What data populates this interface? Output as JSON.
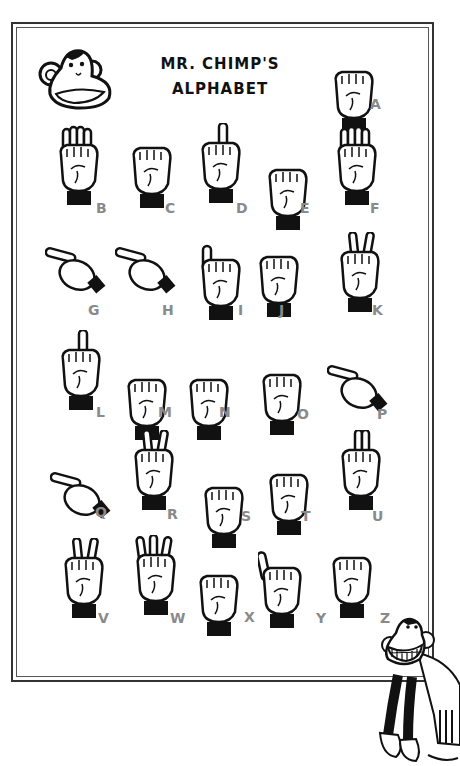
{
  "poster": {
    "title_line1": "MR. CHIMP'S",
    "title_line2": "ALPHABET",
    "logo_icon": "chimp-head-icon",
    "mascot_icon": "grinning-chimp-icon",
    "letter_color": "#8a8a8a",
    "line_color": "#111111"
  },
  "signs": [
    {
      "letter": "A",
      "pose": "fist-thumb-side",
      "x": 330,
      "y": 52
    },
    {
      "letter": "B",
      "pose": "flat-hand-thumb-in",
      "x": 55,
      "y": 125
    },
    {
      "letter": "C",
      "pose": "curved-hand",
      "x": 128,
      "y": 128
    },
    {
      "letter": "D",
      "pose": "index-up",
      "x": 197,
      "y": 123
    },
    {
      "letter": "E",
      "pose": "curled-fingers",
      "x": 264,
      "y": 150
    },
    {
      "letter": "F",
      "pose": "three-up-ok",
      "x": 333,
      "y": 125
    },
    {
      "letter": "G",
      "pose": "point-sideways",
      "x": 45,
      "y": 245
    },
    {
      "letter": "H",
      "pose": "two-sideways",
      "x": 115,
      "y": 245
    },
    {
      "letter": "I",
      "pose": "pinky-up",
      "x": 197,
      "y": 240
    },
    {
      "letter": "J",
      "pose": "pinky-hook",
      "x": 255,
      "y": 237
    },
    {
      "letter": "K",
      "pose": "v-thumb-between",
      "x": 336,
      "y": 232
    },
    {
      "letter": "L",
      "pose": "l-shape",
      "x": 57,
      "y": 330
    },
    {
      "letter": "M",
      "pose": "three-over-thumb",
      "x": 123,
      "y": 360
    },
    {
      "letter": "N",
      "pose": "two-over-thumb",
      "x": 185,
      "y": 360
    },
    {
      "letter": "O",
      "pose": "o-shape",
      "x": 258,
      "y": 355
    },
    {
      "letter": "P",
      "pose": "k-down",
      "x": 327,
      "y": 363
    },
    {
      "letter": "Q",
      "pose": "g-down",
      "x": 50,
      "y": 470
    },
    {
      "letter": "R",
      "pose": "crossed-fingers",
      "x": 130,
      "y": 430
    },
    {
      "letter": "S",
      "pose": "fist-thumb-front",
      "x": 200,
      "y": 468
    },
    {
      "letter": "T",
      "pose": "thumb-under-index",
      "x": 265,
      "y": 455
    },
    {
      "letter": "U",
      "pose": "two-up-together",
      "x": 337,
      "y": 430
    },
    {
      "letter": "V",
      "pose": "v-sign",
      "x": 60,
      "y": 538
    },
    {
      "letter": "W",
      "pose": "three-up",
      "x": 132,
      "y": 535
    },
    {
      "letter": "X",
      "pose": "hooked-index",
      "x": 195,
      "y": 556
    },
    {
      "letter": "Y",
      "pose": "thumb-pinky-out",
      "x": 258,
      "y": 548
    },
    {
      "letter": "Z",
      "pose": "index-trace-z",
      "x": 328,
      "y": 538
    }
  ],
  "labels": [
    {
      "letter": "A",
      "x": 370,
      "y": 104
    },
    {
      "letter": "B",
      "x": 96,
      "y": 208
    },
    {
      "letter": "C",
      "x": 165,
      "y": 208
    },
    {
      "letter": "D",
      "x": 236,
      "y": 208
    },
    {
      "letter": "E",
      "x": 300,
      "y": 208
    },
    {
      "letter": "F",
      "x": 370,
      "y": 208
    },
    {
      "letter": "G",
      "x": 88,
      "y": 310
    },
    {
      "letter": "H",
      "x": 162,
      "y": 310
    },
    {
      "letter": "I",
      "x": 238,
      "y": 310
    },
    {
      "letter": "J",
      "x": 279,
      "y": 310
    },
    {
      "letter": "K",
      "x": 372,
      "y": 310
    },
    {
      "letter": "L",
      "x": 96,
      "y": 412
    },
    {
      "letter": "M",
      "x": 158,
      "y": 412
    },
    {
      "letter": "N",
      "x": 219,
      "y": 412
    },
    {
      "letter": "O",
      "x": 297,
      "y": 414
    },
    {
      "letter": "P",
      "x": 377,
      "y": 414
    },
    {
      "letter": "Q",
      "x": 95,
      "y": 512
    },
    {
      "letter": "R",
      "x": 167,
      "y": 514
    },
    {
      "letter": "S",
      "x": 241,
      "y": 516
    },
    {
      "letter": "T",
      "x": 301,
      "y": 516
    },
    {
      "letter": "U",
      "x": 372,
      "y": 516
    },
    {
      "letter": "V",
      "x": 98,
      "y": 618
    },
    {
      "letter": "W",
      "x": 170,
      "y": 618
    },
    {
      "letter": "X",
      "x": 244,
      "y": 617
    },
    {
      "letter": "Y",
      "x": 316,
      "y": 618
    },
    {
      "letter": "Z",
      "x": 380,
      "y": 618
    }
  ]
}
